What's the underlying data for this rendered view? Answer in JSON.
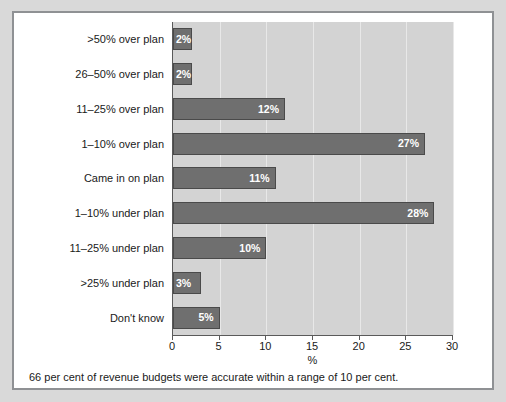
{
  "chart_data": {
    "type": "bar",
    "orientation": "horizontal",
    "title": "",
    "subtitle": "",
    "xlabel": "%",
    "ylabel": "",
    "xlim": [
      0,
      30
    ],
    "xticks": [
      0,
      5,
      10,
      15,
      20,
      25,
      30
    ],
    "xtick_labels": [
      "0",
      "5",
      "10",
      "15",
      "20",
      "25",
      "30"
    ],
    "grid": true,
    "grid_axis": "x",
    "legend": false,
    "categories": [
      ">50% over plan",
      "26–50% over plan",
      "11–25% over plan",
      "1–10% over plan",
      "Came in on plan",
      "1–10% under plan",
      "11–25% under plan",
      ">25% under plan",
      "Don't know"
    ],
    "values": [
      2,
      2,
      12,
      27,
      11,
      28,
      10,
      3,
      5
    ],
    "data_labels": [
      "2%",
      "2%",
      "12%",
      "27%",
      "11%",
      "28%",
      "10%",
      "3%",
      "5%"
    ],
    "caption": "66 per cent of revenue budgets were accurate within a range of 10 per cent.",
    "colors": {
      "bar_fill": "#6f6f6f",
      "bar_border": "#4a4a4a",
      "plot_background": "#d3d3d3",
      "gridline": "#e8e8e8",
      "axis": "#5a5a5a",
      "data_label_text": "#ffffff",
      "text": "#1a1a1a",
      "figure_background": "#ffffff",
      "page_background": "#d9d9d9",
      "frame_border": "#8f9194"
    }
  }
}
